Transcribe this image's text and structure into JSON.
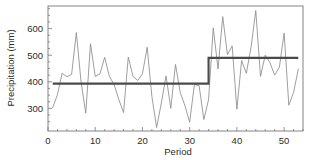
{
  "chart_data": {
    "type": "line",
    "title": "",
    "subtitle": "",
    "xlabel": "Period",
    "ylabel": "Precipitation (mm)",
    "xlim": [
      0,
      54
    ],
    "ylim": [
      215,
      685
    ],
    "xticks": [
      0,
      10,
      20,
      30,
      40,
      50
    ],
    "xtick_labels": [
      "0",
      "10",
      "20",
      "30",
      "40",
      "50"
    ],
    "yticks": [
      300,
      400,
      500,
      600
    ],
    "ytick_labels": [
      "300",
      "400",
      "500",
      "600"
    ],
    "grid": false,
    "legend": "none",
    "frame": "box",
    "colors": {
      "series_line": "#8c8c8c",
      "step_line": "#4a4a4a",
      "axis": "#6e6e6e",
      "text": "#2b2b2b",
      "background": "#ffffff"
    },
    "x": [
      1,
      2,
      3,
      4,
      5,
      6,
      7,
      8,
      9,
      10,
      11,
      12,
      13,
      14,
      15,
      16,
      17,
      18,
      19,
      20,
      21,
      22,
      23,
      24,
      25,
      26,
      27,
      28,
      29,
      30,
      31,
      32,
      33,
      34,
      35,
      36,
      37,
      38,
      39,
      40,
      41,
      42,
      43,
      44,
      45,
      46,
      47,
      48,
      49,
      50,
      51,
      52,
      53
    ],
    "series": [
      {
        "name": "Precipitation",
        "style": "line",
        "values": [
          303,
          352,
          432,
          419,
          428,
          585,
          400,
          282,
          543,
          420,
          430,
          492,
          420,
          390,
          333,
          284,
          493,
          420,
          405,
          430,
          530,
          345,
          228,
          320,
          422,
          300,
          465,
          360,
          310,
          248,
          390,
          385,
          258,
          333,
          603,
          448,
          645,
          502,
          535,
          297,
          480,
          432,
          530,
          668,
          420,
          500,
          472,
          425,
          455,
          583,
          312,
          360,
          447
        ]
      },
      {
        "name": "Step mean",
        "style": "step",
        "segments": [
          {
            "x_start": 1,
            "x_end": 34,
            "value": 393
          },
          {
            "x_start": 34,
            "x_end": 53,
            "value": 490
          }
        ],
        "change_point": 34
      }
    ],
    "annotations": []
  },
  "axes": {
    "y_title": "Precipitation (mm)",
    "x_title": "Period"
  }
}
